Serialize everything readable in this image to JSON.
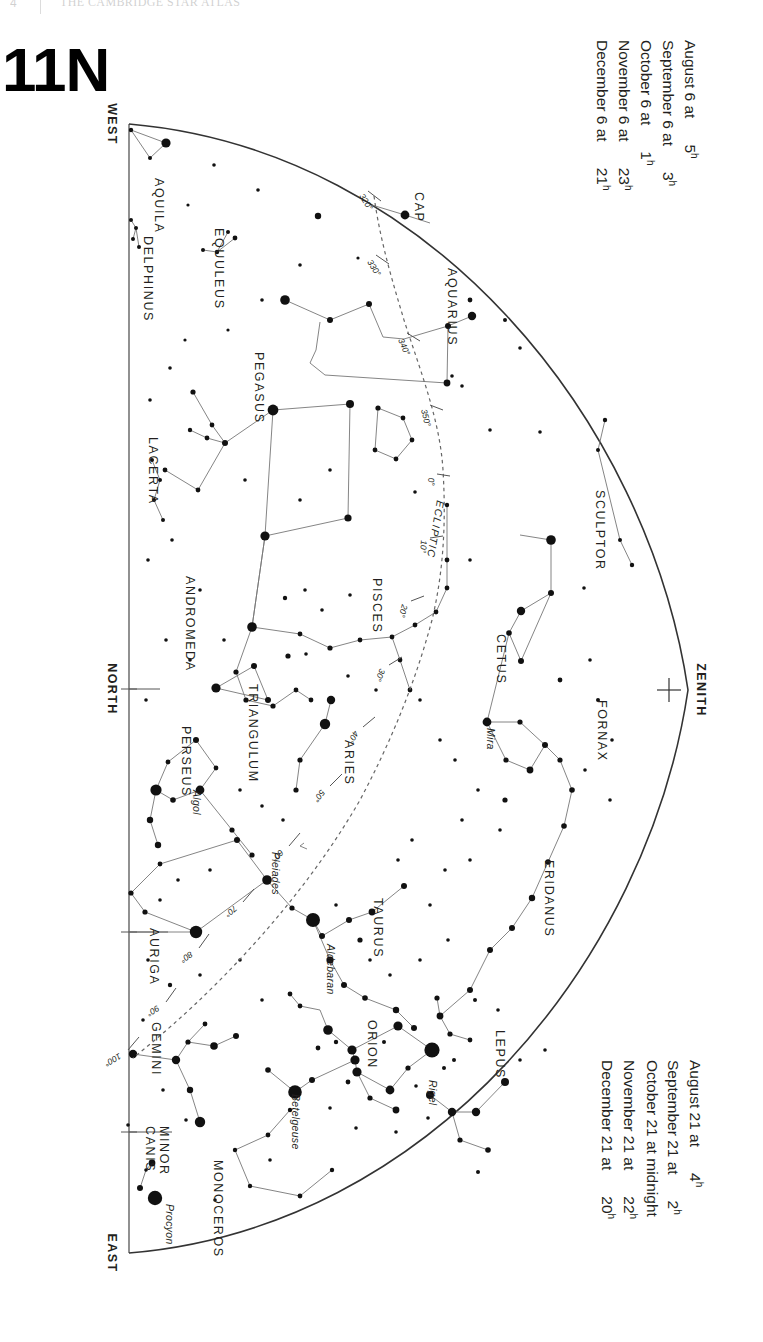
{
  "running_head": {
    "page_number": "4",
    "text": "THE CAMBRIDGE STAR ATLAS"
  },
  "chart": {
    "number": "11N",
    "hemisphere_label": "N"
  },
  "legend_top": {
    "rows": [
      {
        "date": "August 6 at",
        "hour": "5",
        "unit": "h"
      },
      {
        "date": "September 6 at",
        "hour": "3",
        "unit": "h"
      },
      {
        "date": "October 6 at",
        "hour": "1",
        "unit": "h"
      },
      {
        "date": "November 6 at",
        "hour": "23",
        "unit": "h"
      },
      {
        "date": "December 6 at",
        "hour": "21",
        "unit": "h"
      }
    ]
  },
  "legend_bottom": {
    "rows": [
      {
        "date": "August 21 at",
        "hour": "4",
        "unit": "h"
      },
      {
        "date": "September 21 at",
        "hour": "2",
        "unit": "h"
      },
      {
        "date": "October 21 at midnight",
        "hour": "",
        "unit": ""
      },
      {
        "date": "November 21 at",
        "hour": "22",
        "unit": "h"
      },
      {
        "date": "December 21 at",
        "hour": "20",
        "unit": "h"
      }
    ]
  },
  "directions": {
    "west": "WEST",
    "north": "NORTH",
    "east": "EAST",
    "zenith": "ZENITH"
  },
  "ecliptic": {
    "label": "ECLIPTIC",
    "degree_marks": [
      "320°",
      "330°",
      "340°",
      "350°",
      "0°",
      "10°",
      "20°",
      "30°",
      "40°",
      "50°",
      "60°",
      "70°",
      "80°",
      "90°",
      "100°"
    ]
  },
  "constellations": [
    {
      "name": "AQUILA",
      "x": 155,
      "y": 178
    },
    {
      "name": "EQUULEUS",
      "x": 215,
      "y": 228
    },
    {
      "name": "DELPHINUS",
      "x": 144,
      "y": 236
    },
    {
      "name": "CAP",
      "x": 415,
      "y": 192
    },
    {
      "name": "AQUARIUS",
      "x": 448,
      "y": 268
    },
    {
      "name": "PEGASUS",
      "x": 255,
      "y": 352
    },
    {
      "name": "LACERTA",
      "x": 149,
      "y": 437
    },
    {
      "name": "SCULPTOR",
      "x": 596,
      "y": 490
    },
    {
      "name": "PISCES",
      "x": 373,
      "y": 578
    },
    {
      "name": "ANDROMEDA",
      "x": 186,
      "y": 576
    },
    {
      "name": "CETUS",
      "x": 497,
      "y": 634
    },
    {
      "name": "TRIANGULUM",
      "x": 249,
      "y": 684
    },
    {
      "name": "FORNAX",
      "x": 598,
      "y": 700
    },
    {
      "name": "PERSEUS",
      "x": 182,
      "y": 726
    },
    {
      "name": "ARIES",
      "x": 345,
      "y": 740
    },
    {
      "name": "ERIDANUS",
      "x": 545,
      "y": 860
    },
    {
      "name": "TAURUS",
      "x": 374,
      "y": 898
    },
    {
      "name": "AURIGA",
      "x": 150,
      "y": 928
    },
    {
      "name": "ORION",
      "x": 368,
      "y": 1020
    },
    {
      "name": "LEPUS",
      "x": 496,
      "y": 1030
    },
    {
      "name": "GEMINI",
      "x": 152,
      "y": 1022
    },
    {
      "name": "CANIS",
      "x": 146,
      "y": 1126
    },
    {
      "name": "MINOR",
      "x": 160,
      "y": 1126
    },
    {
      "name": "MONOCEROS",
      "x": 214,
      "y": 1160
    }
  ],
  "named_stars": [
    {
      "name": "Mira",
      "x": 487,
      "y": 728
    },
    {
      "name": "Algol",
      "x": 193,
      "y": 790
    },
    {
      "name": "Pleiades",
      "x": 272,
      "y": 852
    },
    {
      "name": "Aldebaran",
      "x": 327,
      "y": 944
    },
    {
      "name": "Betelgeuse",
      "x": 292,
      "y": 1094
    },
    {
      "name": "Rigel",
      "x": 429,
      "y": 1080
    },
    {
      "name": "Procyon",
      "x": 166,
      "y": 1204
    }
  ],
  "colors": {
    "ink": "#231f20",
    "line": "#555555",
    "horizon": "#333333",
    "ecliptic": "#666666",
    "paper": "#ffffff"
  }
}
